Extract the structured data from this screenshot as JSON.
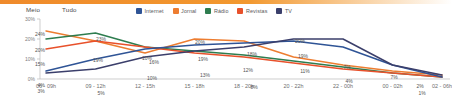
{
  "header": {
    "meio_label": "Meio",
    "tudo_label": "Tudo"
  },
  "legend": {
    "position": "top-right",
    "items": [
      {
        "label": "Internet",
        "color": "#2f5496",
        "icon": "legend-swatch-icon"
      },
      {
        "label": "Jornal",
        "color": "#ed7d31",
        "icon": "legend-swatch-icon"
      },
      {
        "label": "Rádio",
        "color": "#2e7d4f",
        "icon": "legend-swatch-icon"
      },
      {
        "label": "Revistas",
        "color": "#e8512b",
        "icon": "legend-swatch-icon"
      },
      {
        "label": "TV",
        "color": "#3b3f6b",
        "icon": "legend-swatch-icon"
      }
    ]
  },
  "chart_data": {
    "type": "line",
    "title": "",
    "subtitle": "",
    "xlabel": "",
    "ylabel": "",
    "ylim": [
      0,
      30
    ],
    "grid": false,
    "legend_position": "top-right",
    "ytick_labels": [
      "30%",
      "20%",
      "10%",
      "0%"
    ],
    "ytick_values": [
      30,
      20,
      10,
      0
    ],
    "categories": [
      "06 - 09h",
      "09 - 12h",
      "12 - 15h",
      "15 - 18h",
      "18 - 20h",
      "20 - 22h",
      "22 - 00h",
      "00 - 02h",
      "02 - 06h"
    ],
    "series": [
      {
        "name": "Jornal",
        "color": "#ed7d31",
        "values": [
          24,
          19,
          13,
          20,
          19,
          11,
          7,
          4,
          2
        ],
        "labels": [
          "24%",
          "19%",
          "13%",
          "20%",
          "19%",
          "11%",
          "7%",
          "4%",
          "2%"
        ]
      },
      {
        "name": "Rádio",
        "color": "#2e7d4f",
        "values": [
          20,
          23,
          16,
          14,
          12,
          9,
          6,
          3,
          1
        ],
        "labels": [
          "20%",
          "23%",
          "16%",
          "14%",
          "12%",
          "9%",
          "6%",
          "3%",
          "1%"
        ]
      },
      {
        "name": "Revistas",
        "color": "#e8512b",
        "values": [
          15,
          19,
          16,
          13,
          11,
          8,
          5,
          3,
          1
        ],
        "labels": [
          "15%",
          "19%",
          "16%",
          "13%",
          "11%",
          "8%",
          "5%",
          "3%",
          "1%"
        ]
      },
      {
        "name": "Internet",
        "color": "#2f5496",
        "values": [
          4,
          10,
          15,
          17,
          18,
          19,
          16,
          7,
          1
        ],
        "labels": [
          "4%",
          "10%",
          "15%",
          "17%",
          "18%",
          "19%",
          "16%",
          "7%",
          "1%"
        ]
      },
      {
        "name": "TV",
        "color": "#3b3f6b",
        "values": [
          3,
          5,
          11,
          14,
          16,
          20,
          20,
          7,
          2
        ],
        "labels": [
          "3%",
          "5%",
          "11%",
          "14%",
          "16%",
          "20%",
          "20%",
          "7%",
          "2%"
        ]
      }
    ],
    "point_labels": [
      {
        "text": "24%",
        "x": 40,
        "y": 19,
        "color": "#555555"
      },
      {
        "text": "20%",
        "x": 40,
        "y": 35,
        "color": "#555555"
      },
      {
        "text": "15%",
        "x": 40,
        "y": 49,
        "color": "#555555"
      },
      {
        "text": "4%",
        "x": 41,
        "y": 70,
        "color": "#555555"
      },
      {
        "text": "3%",
        "x": 41,
        "y": 76,
        "color": "#555555"
      },
      {
        "text": "23%",
        "x": 101,
        "y": 24,
        "color": "#555555"
      },
      {
        "text": "19%",
        "x": 98,
        "y": 45,
        "color": "#555555"
      },
      {
        "text": "5%",
        "x": 101,
        "y": 78,
        "color": "#555555"
      },
      {
        "text": "10%",
        "x": 147,
        "y": 43,
        "color": "#555555"
      },
      {
        "text": "16%",
        "x": 154,
        "y": 47,
        "color": "#555555"
      },
      {
        "text": "10%",
        "x": 152,
        "y": 63,
        "color": "#555555"
      },
      {
        "text": "20%",
        "x": 200,
        "y": 27,
        "color": "#555555"
      },
      {
        "text": "19%",
        "x": 203,
        "y": 44,
        "color": "#555555"
      },
      {
        "text": "13%",
        "x": 205,
        "y": 60,
        "color": "#555555"
      },
      {
        "text": "12%",
        "x": 248,
        "y": 55,
        "color": "#555555"
      },
      {
        "text": "18%",
        "x": 252,
        "y": 39,
        "color": "#555555"
      },
      {
        "text": "8%",
        "x": 254,
        "y": 72,
        "color": "#555555"
      },
      {
        "text": "20%",
        "x": 300,
        "y": 26,
        "color": "#555555"
      },
      {
        "text": "19%",
        "x": 303,
        "y": 41,
        "color": "#555555"
      },
      {
        "text": "11%",
        "x": 305,
        "y": 56,
        "color": "#555555"
      },
      {
        "text": "7%",
        "x": 347,
        "y": 52,
        "color": "#555555"
      },
      {
        "text": "4%",
        "x": 349,
        "y": 66,
        "color": "#555555"
      },
      {
        "text": "7%",
        "x": 394,
        "y": 62,
        "color": "#555555"
      },
      {
        "text": "2%",
        "x": 420,
        "y": 71,
        "color": "#555555"
      },
      {
        "text": "1%",
        "x": 422,
        "y": 78,
        "color": "#555555"
      }
    ]
  }
}
